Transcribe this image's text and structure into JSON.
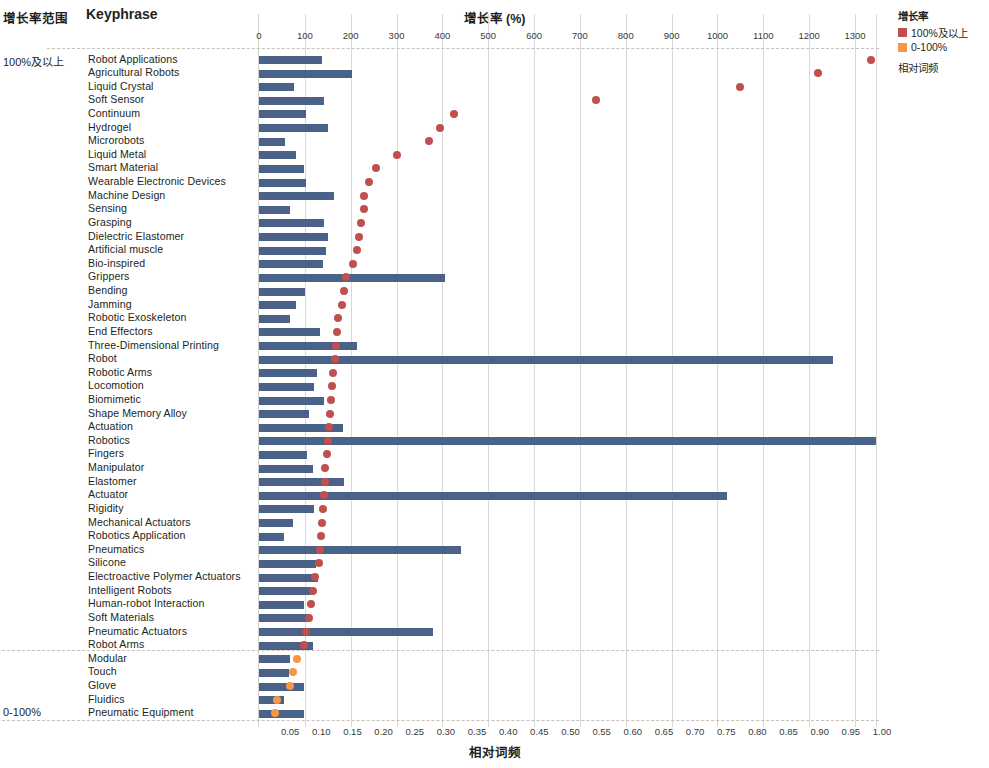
{
  "header": {
    "range_column_title": "增长率范围",
    "keyphrase_column_title": "Keyphrase"
  },
  "legend": {
    "title": "增长率",
    "items": [
      {
        "label": "100%及以上",
        "color": "#c0504d",
        "shape": "square"
      },
      {
        "label": "0-100%",
        "color": "#f79646",
        "shape": "square"
      },
      {
        "label": "相对词频",
        "color": "#41608e",
        "shape": "square"
      }
    ]
  },
  "groups": [
    {
      "label": "100%及以上",
      "row_start": 0,
      "row_end": 47
    },
    {
      "label": "0-100%",
      "row_start": 48,
      "row_end": 52
    }
  ],
  "chart_data": {
    "type": "bar",
    "title": "",
    "top_axis": {
      "label": "增长率  (%)",
      "ticks": [
        0,
        100,
        200,
        300,
        400,
        500,
        600,
        700,
        800,
        900,
        1000,
        1100,
        1200,
        1300
      ],
      "range": [
        0,
        1350
      ]
    },
    "bottom_axis": {
      "label": "相对词频",
      "ticks": [
        0.05,
        0.1,
        0.15,
        0.2,
        0.25,
        0.3,
        0.35,
        0.4,
        0.45,
        0.5,
        0.55,
        0.6,
        0.65,
        0.7,
        0.75,
        0.8,
        0.85,
        0.9,
        0.95,
        1.0
      ],
      "range": [
        0,
        1.0
      ]
    },
    "grid": true,
    "legend_position": "top-right",
    "categories": [
      "Robot Applications",
      "Agricultural Robots",
      "Liquid Crystal",
      "Soft Sensor",
      "Continuum",
      "Hydrogel",
      "Microrobots",
      "Liquid Metal",
      "Smart Material",
      "Wearable Electronic Devices",
      "Machine Design",
      "Sensing",
      "Grasping",
      "Dielectric Elastomer",
      "Artificial muscle",
      "Bio-inspired",
      "Grippers",
      "Bending",
      "Jamming",
      "Robotic Exoskeleton",
      "End Effectors",
      "Three-Dimensional Printing",
      "Robot",
      "Robotic Arms",
      "Locomotion",
      "Biomimetic",
      "Shape Memory Alloy",
      "Actuation",
      "Robotics",
      "Fingers",
      "Manipulator",
      "Elastomer",
      "Actuator",
      "Rigidity",
      "Mechanical Actuators",
      "Robotics Application",
      "Pneumatics",
      "Silicone",
      "Electroactive Polymer Actuators",
      "Intelligent Robots",
      "Human-robot Interaction",
      "Soft Materials",
      "Pneumatic Actuators",
      "Robot Arms",
      "Modular",
      "Touch",
      "Glove",
      "Fluidics",
      "Pneumatic Equipment"
    ],
    "series": [
      {
        "name": "相对词频",
        "type": "bar",
        "color": "#4a6287",
        "values": [
          0.101,
          0.15,
          0.056,
          0.105,
          0.075,
          0.11,
          0.041,
          0.06,
          0.072,
          0.075,
          0.121,
          0.05,
          0.104,
          0.11,
          0.108,
          0.103,
          0.298,
          0.074,
          0.059,
          0.05,
          0.098,
          0.158,
          0.922,
          0.093,
          0.088,
          0.104,
          0.08,
          0.135,
          0.99,
          0.077,
          0.086,
          0.137,
          0.752,
          0.089,
          0.055,
          0.04,
          0.325,
          0.092,
          0.095,
          0.083,
          0.073,
          0.082,
          0.28,
          0.086,
          0.049,
          0.048,
          0.073,
          0.04,
          0.072
        ]
      },
      {
        "name": "增长率",
        "type": "scatter",
        "values": [
          1335,
          1220,
          1050,
          735,
          425,
          395,
          370,
          300,
          255,
          240,
          230,
          228,
          222,
          218,
          213,
          205,
          190,
          185,
          180,
          173,
          170,
          167,
          165,
          162,
          160,
          158,
          155,
          152,
          150,
          148,
          145,
          143,
          142,
          140,
          138,
          135,
          133,
          130,
          122,
          118,
          113,
          108,
          103,
          98,
          82,
          75,
          68,
          40,
          35
        ]
      }
    ]
  },
  "rows": [
    {
      "label": "Robot Applications",
      "freq": 0.101,
      "growth": 1335,
      "band": "hi"
    },
    {
      "label": "Agricultural Robots",
      "freq": 0.15,
      "growth": 1220,
      "band": "hi"
    },
    {
      "label": "Liquid Crystal",
      "freq": 0.056,
      "growth": 1050,
      "band": "hi"
    },
    {
      "label": "Soft Sensor",
      "freq": 0.105,
      "growth": 735,
      "band": "hi"
    },
    {
      "label": "Continuum",
      "freq": 0.075,
      "growth": 425,
      "band": "hi"
    },
    {
      "label": "Hydrogel",
      "freq": 0.11,
      "growth": 395,
      "band": "hi"
    },
    {
      "label": "Microrobots",
      "freq": 0.041,
      "growth": 370,
      "band": "hi"
    },
    {
      "label": "Liquid Metal",
      "freq": 0.06,
      "growth": 300,
      "band": "hi"
    },
    {
      "label": "Smart Material",
      "freq": 0.072,
      "growth": 255,
      "band": "hi"
    },
    {
      "label": "Wearable Electronic Devices",
      "freq": 0.075,
      "growth": 240,
      "band": "hi"
    },
    {
      "label": "Machine Design",
      "freq": 0.121,
      "growth": 230,
      "band": "hi"
    },
    {
      "label": "Sensing",
      "freq": 0.05,
      "growth": 228,
      "band": "hi"
    },
    {
      "label": "Grasping",
      "freq": 0.104,
      "growth": 222,
      "band": "hi"
    },
    {
      "label": "Dielectric Elastomer",
      "freq": 0.11,
      "growth": 218,
      "band": "hi"
    },
    {
      "label": "Artificial muscle",
      "freq": 0.108,
      "growth": 213,
      "band": "hi"
    },
    {
      "label": "Bio-inspired",
      "freq": 0.103,
      "growth": 205,
      "band": "hi"
    },
    {
      "label": "Grippers",
      "freq": 0.298,
      "growth": 190,
      "band": "hi"
    },
    {
      "label": "Bending",
      "freq": 0.074,
      "growth": 185,
      "band": "hi"
    },
    {
      "label": "Jamming",
      "freq": 0.059,
      "growth": 180,
      "band": "hi"
    },
    {
      "label": "Robotic Exoskeleton",
      "freq": 0.05,
      "growth": 173,
      "band": "hi"
    },
    {
      "label": "End Effectors",
      "freq": 0.098,
      "growth": 170,
      "band": "hi"
    },
    {
      "label": "Three-Dimensional Printing",
      "freq": 0.158,
      "growth": 167,
      "band": "hi"
    },
    {
      "label": "Robot",
      "freq": 0.922,
      "growth": 165,
      "band": "hi"
    },
    {
      "label": "Robotic Arms",
      "freq": 0.093,
      "growth": 162,
      "band": "hi"
    },
    {
      "label": "Locomotion",
      "freq": 0.088,
      "growth": 160,
      "band": "hi"
    },
    {
      "label": "Biomimetic",
      "freq": 0.104,
      "growth": 158,
      "band": "hi"
    },
    {
      "label": "Shape Memory Alloy",
      "freq": 0.08,
      "growth": 155,
      "band": "hi"
    },
    {
      "label": "Actuation",
      "freq": 0.135,
      "growth": 152,
      "band": "hi"
    },
    {
      "label": "Robotics",
      "freq": 0.99,
      "growth": 150,
      "band": "hi"
    },
    {
      "label": "Fingers",
      "freq": 0.077,
      "growth": 148,
      "band": "hi"
    },
    {
      "label": "Manipulator",
      "freq": 0.086,
      "growth": 145,
      "band": "hi"
    },
    {
      "label": "Elastomer",
      "freq": 0.137,
      "growth": 143,
      "band": "hi"
    },
    {
      "label": "Actuator",
      "freq": 0.752,
      "growth": 142,
      "band": "hi"
    },
    {
      "label": "Rigidity",
      "freq": 0.089,
      "growth": 140,
      "band": "hi"
    },
    {
      "label": "Mechanical Actuators",
      "freq": 0.055,
      "growth": 138,
      "band": "hi"
    },
    {
      "label": "Robotics Application",
      "freq": 0.04,
      "growth": 135,
      "band": "hi"
    },
    {
      "label": "Pneumatics",
      "freq": 0.325,
      "growth": 133,
      "band": "hi"
    },
    {
      "label": "Silicone",
      "freq": 0.092,
      "growth": 130,
      "band": "hi"
    },
    {
      "label": "Electroactive Polymer Actuators",
      "freq": 0.095,
      "growth": 122,
      "band": "hi"
    },
    {
      "label": "Intelligent Robots",
      "freq": 0.083,
      "growth": 118,
      "band": "hi"
    },
    {
      "label": "Human-robot Interaction",
      "freq": 0.073,
      "growth": 113,
      "band": "hi"
    },
    {
      "label": "Soft Materials",
      "freq": 0.082,
      "growth": 108,
      "band": "hi"
    },
    {
      "label": "Pneumatic Actuators",
      "freq": 0.28,
      "growth": 103,
      "band": "hi"
    },
    {
      "label": "Robot Arms",
      "freq": 0.086,
      "growth": 98,
      "band": "hi"
    },
    {
      "label": "Modular",
      "freq": 0.049,
      "growth": 82,
      "band": "lo"
    },
    {
      "label": "Touch",
      "freq": 0.048,
      "growth": 75,
      "band": "lo"
    },
    {
      "label": "Glove",
      "freq": 0.073,
      "growth": 68,
      "band": "lo"
    },
    {
      "label": "Fluidics",
      "freq": 0.04,
      "growth": 40,
      "band": "lo"
    },
    {
      "label": "Pneumatic Equipment",
      "freq": 0.072,
      "growth": 35,
      "band": "lo"
    }
  ],
  "colors": {
    "bar": "#4a6287",
    "dot_high": "#c0504d",
    "dot_low": "#f79646",
    "grid": "#d9d9d9",
    "dashed": "#c8c0b8"
  }
}
